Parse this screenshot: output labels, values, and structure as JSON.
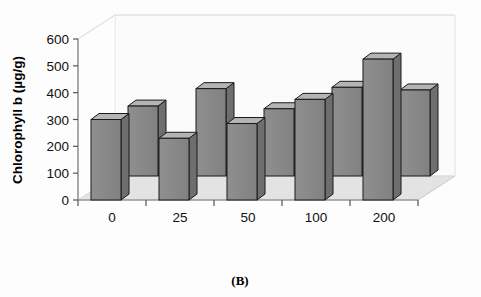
{
  "figure": {
    "panel_label": "(B)",
    "background_color": "#fdfdfd"
  },
  "chart_data": {
    "type": "bar",
    "title": "",
    "subtitle": "",
    "xlabel": "",
    "ylabel": "Chlorophyll b (µg/g)",
    "categories": [
      "0",
      "25",
      "50",
      "100",
      "200"
    ],
    "ylim": [
      0,
      600
    ],
    "yticks": [
      0,
      100,
      200,
      300,
      400,
      500,
      600
    ],
    "ytick_labels": [
      "0",
      "100",
      "200",
      "300",
      "400",
      "500",
      "600"
    ],
    "grid": false,
    "legend_position": "none",
    "style": "3d-bar",
    "series": [
      {
        "name": "front",
        "values": [
          300,
          230,
          285,
          375,
          525
        ],
        "color": "#8a8a8a"
      },
      {
        "name": "back",
        "values": [
          350,
          415,
          340,
          420,
          410
        ],
        "color": "#8a8a8a"
      }
    ],
    "annotations": [],
    "colors": {
      "bar_front_face": "#8a8a8a",
      "bar_side_face": "#6e6e6e",
      "bar_top_face": "#b4b4b4",
      "bar_outline": "#1a1a1a",
      "floor": "#e2e2e2",
      "wall": "#fbfbfb",
      "axis": "#555555",
      "text": "#000000"
    }
  },
  "ticks": {
    "y": [
      "600",
      "500",
      "400",
      "300",
      "200",
      "100",
      "0"
    ],
    "x": [
      "0",
      "25",
      "50",
      "100",
      "200"
    ]
  }
}
